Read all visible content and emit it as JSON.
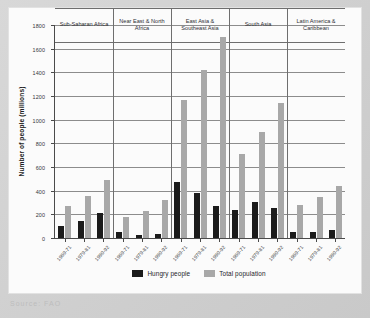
{
  "source_note": "Source: FAO",
  "chart_data": {
    "type": "bar",
    "title": "",
    "xlabel": "",
    "ylabel": "Number of people (millions)",
    "ylim": [
      0,
      1800
    ],
    "ytick_step": 200,
    "yticks": [
      0,
      200,
      400,
      600,
      800,
      1000,
      1200,
      1400,
      1600,
      1800
    ],
    "grid": true,
    "legend_position": "bottom",
    "categories": [
      "1969-71",
      "1979-81",
      "1990-92"
    ],
    "panels": [
      {
        "name": "Sub-Saharan Africa",
        "periods": [
          "1969-71",
          "1979-81",
          "1990-92"
        ],
        "series": [
          {
            "name": "Hungry people",
            "values": [
              103,
              148,
              215
            ]
          },
          {
            "name": "Total population",
            "values": [
              268,
              358,
              494
            ]
          }
        ]
      },
      {
        "name": "Near East & North Africa",
        "periods": [
          "1969-71",
          "1979-81",
          "1990-92"
        ],
        "series": [
          {
            "name": "Hungry people",
            "values": [
              48,
              23,
              37
            ]
          },
          {
            "name": "Total population",
            "values": [
              178,
              231,
              323
            ]
          }
        ]
      },
      {
        "name": "East Asia & Southeast Asia",
        "periods": [
          "1969-71",
          "1979-81",
          "1990-92"
        ],
        "series": [
          {
            "name": "Hungry people",
            "values": [
              476,
              379,
              269
            ]
          },
          {
            "name": "Total population",
            "values": [
              1168,
              1420,
              1698
            ]
          }
        ]
      },
      {
        "name": "South Asia",
        "periods": [
          "1969-71",
          "1979-81",
          "1990-92"
        ],
        "series": [
          {
            "name": "Hungry people",
            "values": [
              233,
              302,
              255
            ]
          },
          {
            "name": "Total population",
            "values": [
              707,
              893,
              1138
            ]
          }
        ]
      },
      {
        "name": "Latin America & Caribbean",
        "periods": [
          "1969-71",
          "1979-81",
          "1990-92"
        ],
        "series": [
          {
            "name": "Hungry people",
            "values": [
              51,
              47,
              64
            ]
          },
          {
            "name": "Total population",
            "values": [
              276,
              350,
              440
            ]
          }
        ]
      }
    ],
    "legend": [
      {
        "label": "Hungry people",
        "color": "#1b1b1b"
      },
      {
        "label": "Total population",
        "color": "#a8a8a8"
      }
    ]
  }
}
